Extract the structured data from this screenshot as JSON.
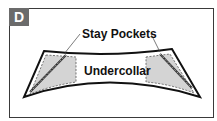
{
  "figure": {
    "badge_letter": "D",
    "labels": {
      "stay_pockets": "Stay Pockets",
      "undercollar": "Undercollar"
    },
    "colors": {
      "pocket_fill": "#d4d4d4",
      "outline": "#111111",
      "badge_bg": "#6b6b6b"
    }
  }
}
